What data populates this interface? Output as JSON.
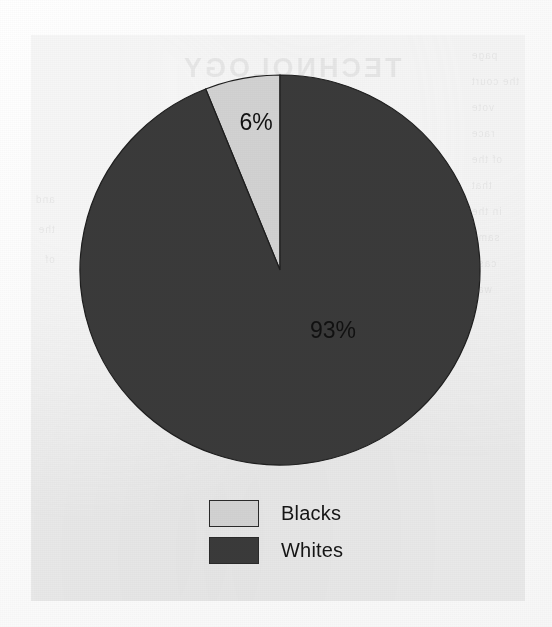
{
  "document": {
    "kind": "scanned-page",
    "paper_color": "#ededed",
    "backdrop_color": "#fdfdfd"
  },
  "bleed_through": {
    "title": "TECHNOLOGY",
    "right_column": "page\nthe court\nvote\nrace\nof the\nthat\nin the\nsame\ncase\nwas",
    "left_column": "and\nthe\nof"
  },
  "chart_data": {
    "type": "pie",
    "title": "",
    "categories": [
      "Blacks",
      "Whites"
    ],
    "values": [
      6,
      93
    ],
    "value_labels": [
      "6%",
      "93%"
    ],
    "colors": [
      "#d2d2d2",
      "#3a3a3a"
    ],
    "legend_position": "bottom",
    "start_angle_deg": 0,
    "direction": "counterclockwise",
    "grid": false,
    "xlabel": "",
    "ylabel": ""
  },
  "pie": {
    "center_x": 249,
    "center_y": 235,
    "radius_x": 200,
    "radius_y": 195,
    "slices": [
      {
        "name": "Blacks",
        "label": "6%",
        "percent": 6,
        "color": "#d2d2d2",
        "label_x": 225,
        "label_y": 95
      },
      {
        "name": "Whites",
        "label": "93%",
        "percent": 93,
        "color": "#3a3a3a",
        "label_x": 302,
        "label_y": 303
      }
    ]
  },
  "legend": {
    "items": [
      {
        "label": "Blacks",
        "color": "#d2d2d2",
        "swatch_name": "legend-swatch-blacks"
      },
      {
        "label": "Whites",
        "color": "#3a3a3a",
        "swatch_name": "legend-swatch-whites"
      }
    ]
  }
}
